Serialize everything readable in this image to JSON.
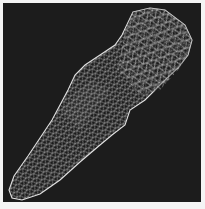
{
  "figure": {
    "background_color": "#1c1c1c",
    "mesh_color": "#d8d8d8",
    "border_color": "#f4f4f4"
  }
}
